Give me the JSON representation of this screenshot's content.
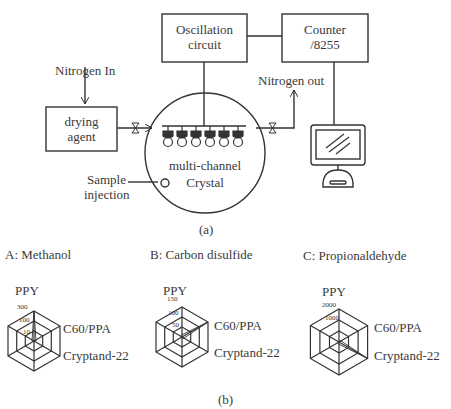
{
  "diagram_a": {
    "caption": "(a)",
    "blocks": {
      "oscillation": {
        "line1": "Oscillation",
        "line2": "circuit"
      },
      "counter": {
        "line1": "Counter",
        "line2": "/8255"
      },
      "drying": {
        "line1": "drying",
        "line2": "agent"
      }
    },
    "labels": {
      "nitrogen_in": "Nitrogen In",
      "nitrogen_out": "Nitrogen out",
      "crystal_line1": "multi-channel",
      "crystal_line2": "Crystal",
      "sample_line1": "Sample",
      "sample_line2": "injection"
    },
    "sensor_count": 6,
    "icons": [
      "valve-icon",
      "computer-monitor-icon",
      "arrow-icon"
    ]
  },
  "diagram_b": {
    "caption": "(b)",
    "panels": [
      {
        "title": "A: Methanol",
        "axis_top": "PPY",
        "axis_right_top": "C60/PPA",
        "axis_right_bottom": "Cryptand-22",
        "ticks": [
          "300",
          "100",
          "10"
        ]
      },
      {
        "title": "B: Carbon disulfide",
        "axis_top": "PPY",
        "axis_right_top": "C60/PPA",
        "axis_right_bottom": "Cryptand-22",
        "ticks": [
          "150",
          "100",
          "50"
        ]
      },
      {
        "title": "C: Propionaldehyde",
        "axis_top": "PPY",
        "axis_right_top": "C60/PPA",
        "axis_right_bottom": "Cryptand-22",
        "ticks": [
          "2000",
          "1000"
        ]
      }
    ]
  },
  "chart_data": [
    {
      "type": "radar",
      "title": "A: Methanol",
      "axes": [
        "PPY",
        "C60/PPA",
        "Cryptand-22"
      ],
      "ticks": [
        10,
        100,
        300
      ],
      "dominant_axis": "PPY"
    },
    {
      "type": "radar",
      "title": "B: Carbon disulfide",
      "axes": [
        "PPY",
        "C60/PPA",
        "Cryptand-22"
      ],
      "ticks": [
        50,
        100,
        150
      ],
      "dominant_axis": "C60/PPA"
    },
    {
      "type": "radar",
      "title": "C: Propionaldehyde",
      "axes": [
        "PPY",
        "C60/PPA",
        "Cryptand-22"
      ],
      "ticks": [
        1000,
        2000
      ],
      "dominant_axis": "Cryptand-22"
    }
  ]
}
